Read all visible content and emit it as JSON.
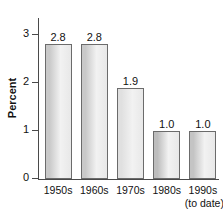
{
  "chart_data": {
    "type": "bar",
    "title": "",
    "subtitle": "",
    "xlabel": "",
    "ylabel": "Percent",
    "categories": [
      "1950s",
      "1960s",
      "1970s",
      "1980s",
      "1990s"
    ],
    "category_sublabels": [
      "",
      "",
      "",
      "",
      "(to date)"
    ],
    "values": [
      2.8,
      2.8,
      1.9,
      1.0,
      1.0
    ],
    "value_labels": [
      "2.8",
      "2.8",
      "1.9",
      "1.0",
      "1.0"
    ],
    "ylim": [
      0,
      3.35
    ],
    "yticks": [
      0,
      1,
      2,
      3
    ],
    "ytick_labels": [
      "0",
      "1",
      "2",
      "3"
    ],
    "grid": false,
    "legend": null,
    "bar_colors": [
      "#c9c9c9",
      "#c9c9c9",
      "#e0e0e0",
      "#bdbdbd",
      "#c4c4c4"
    ],
    "bar_edge_color": "#6b6b6b",
    "axis_color": "#4a4a4a",
    "text_color": "#111111",
    "background": "#ffffff"
  }
}
